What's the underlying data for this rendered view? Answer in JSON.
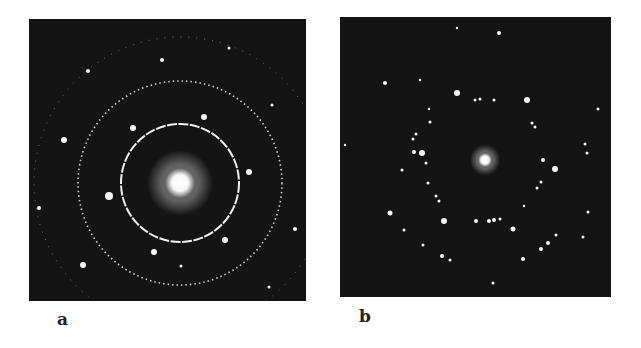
{
  "figure": {
    "panels": [
      {
        "id": "a",
        "label": "a",
        "description": "Electron diffraction pattern with concentric rings and bright spots",
        "center": [
          151,
          164
        ],
        "central_spot_radius": 15,
        "rings": [
          {
            "radius": 59,
            "style": "solid-bright"
          },
          {
            "radius": 102,
            "style": "dotted"
          },
          {
            "radius": 146,
            "style": "faint-partial"
          }
        ],
        "spots": [
          [
            133,
            41,
            2
          ],
          [
            59,
            52,
            2
          ],
          [
            35,
            121,
            3
          ],
          [
            104,
            109,
            3
          ],
          [
            175,
            98,
            3
          ],
          [
            220,
            153,
            3
          ],
          [
            80,
            177,
            4
          ],
          [
            10,
            189,
            2
          ],
          [
            125,
            233,
            3
          ],
          [
            196,
            221,
            3
          ],
          [
            54,
            246,
            3
          ],
          [
            266,
            210,
            2
          ],
          [
            243,
            86,
            1.5
          ],
          [
            200,
            29,
            1.5
          ],
          [
            240,
            268,
            1.5
          ],
          [
            152,
            247,
            1.5
          ]
        ]
      },
      {
        "id": "b",
        "label": "b",
        "description": "Electron diffraction pattern with hexagonal spot arrangement",
        "center": [
          145,
          143
        ],
        "central_spot_radius": 7,
        "spots": [
          [
            159,
            16,
            2
          ],
          [
            117,
            11,
            1.2
          ],
          [
            45,
            66,
            2
          ],
          [
            117,
            76,
            3
          ],
          [
            187,
            83,
            3
          ],
          [
            135,
            83,
            1.5
          ],
          [
            140,
            82,
            1.5
          ],
          [
            154,
            83,
            1.5
          ],
          [
            89,
            92,
            1.2
          ],
          [
            90,
            105,
            1.5
          ],
          [
            192,
            106,
            1.5
          ],
          [
            195,
            110,
            1.5
          ],
          [
            76,
            117,
            1.5
          ],
          [
            73,
            122,
            1.5
          ],
          [
            74,
            135,
            2
          ],
          [
            82,
            136,
            3
          ],
          [
            86,
            146,
            1.5
          ],
          [
            203,
            143,
            2
          ],
          [
            215,
            152,
            3
          ],
          [
            62,
            153,
            1.5
          ],
          [
            88,
            166,
            1.5
          ],
          [
            201,
            165,
            1.5
          ],
          [
            197,
            171,
            1.5
          ],
          [
            96,
            179,
            1.5
          ],
          [
            99,
            184,
            1.5
          ],
          [
            50,
            196,
            2.5
          ],
          [
            184,
            189,
            1.2
          ],
          [
            104,
            204,
            3
          ],
          [
            136,
            204,
            2
          ],
          [
            149,
            204,
            2
          ],
          [
            154,
            203,
            2
          ],
          [
            160,
            202,
            1.5
          ],
          [
            173,
            212,
            2.5
          ],
          [
            248,
            195,
            1.5
          ],
          [
            64,
            213,
            1.5
          ],
          [
            216,
            218,
            1.5
          ],
          [
            208,
            226,
            2
          ],
          [
            201,
            232,
            2
          ],
          [
            83,
            228,
            1.5
          ],
          [
            102,
            239,
            2
          ],
          [
            110,
            243,
            1.5
          ],
          [
            183,
            242,
            2
          ],
          [
            243,
            220,
            1.5
          ],
          [
            153,
            266,
            1.5
          ],
          [
            258,
            92,
            1.5
          ],
          [
            245,
            127,
            1.5
          ],
          [
            247,
            136,
            1.5
          ],
          [
            5,
            128,
            1.2
          ],
          [
            80,
            63,
            1.2
          ]
        ]
      }
    ]
  }
}
